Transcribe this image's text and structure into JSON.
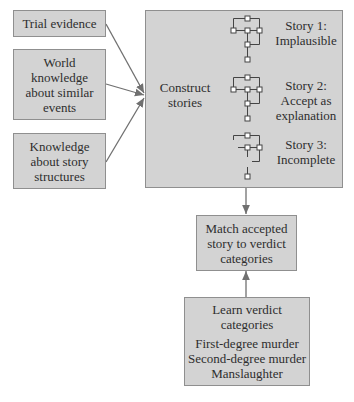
{
  "inputs": [
    {
      "lines": [
        "Trial evidence"
      ]
    },
    {
      "lines": [
        "World",
        "knowledge",
        "about similar",
        "events"
      ]
    },
    {
      "lines": [
        "Knowledge",
        "about story",
        "structures"
      ]
    }
  ],
  "construct": {
    "label_lines": [
      "Construct",
      "stories"
    ],
    "stories": [
      {
        "lines": [
          "Story 1:",
          "Implausible"
        ]
      },
      {
        "lines": [
          "Story 2:",
          "Accept as",
          "explanation"
        ]
      },
      {
        "lines": [
          "Story 3:",
          "Incomplete"
        ]
      }
    ]
  },
  "match": {
    "lines": [
      "Match accepted",
      "story to verdict",
      "categories"
    ]
  },
  "learn": {
    "title_lines": [
      "Learn verdict",
      "categories"
    ],
    "categories": [
      "First-degree murder",
      "Second-degree murder",
      "Manslaughter"
    ]
  },
  "colors": {
    "box_fill": "#d3d3d3",
    "box_border": "#8f8f8f",
    "arrow": "#707070",
    "text": "#2e2e2e"
  }
}
